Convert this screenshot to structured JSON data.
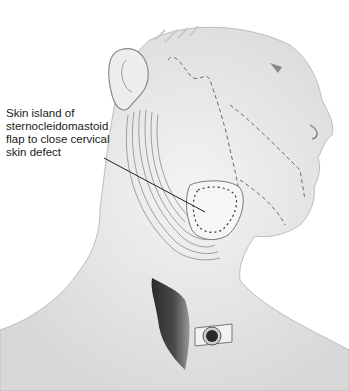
{
  "figure": {
    "annotation": {
      "lines": [
        "Skin island of",
        "sternocleidomastoid",
        "flap to close cervical",
        "skin defect"
      ]
    },
    "structures": [
      "ear-icon",
      "face-profile",
      "dashed-incision-line",
      "sternocleidomastoid-muscle-flap",
      "sutured-skin-island",
      "tracheostomy-tube",
      "muscle-pedicle"
    ],
    "colors": {
      "background": "#ffffff",
      "pencil": "#555555",
      "shade": "#9a9a9a",
      "text": "#1a1a1a"
    }
  }
}
